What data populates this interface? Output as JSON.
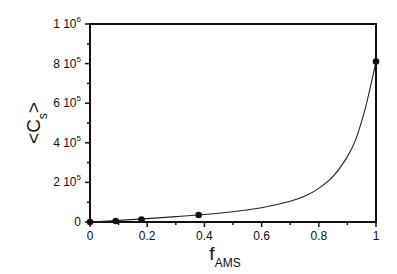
{
  "chart_data": {
    "type": "scatter",
    "title": "",
    "xlabel": "f_AMS",
    "xlabel_main": "f",
    "xlabel_sub": "AMS",
    "ylabel": "<C_s>",
    "ylabel_main": "<C",
    "ylabel_sub": "s",
    "ylabel_end": ">",
    "xlim": [
      0,
      1
    ],
    "ylim": [
      0,
      1000000
    ],
    "x_ticks": [
      0,
      0.2,
      0.4,
      0.6,
      0.8,
      1
    ],
    "x_tick_labels": [
      "0",
      "0.2",
      "0.4",
      "0.6",
      "0.8",
      "1"
    ],
    "y_ticks": [
      0,
      200000,
      400000,
      600000,
      800000,
      1000000
    ],
    "y_tick_labels": [
      {
        "mant": "0",
        "exp": ""
      },
      {
        "mant": "2 10",
        "exp": "5"
      },
      {
        "mant": "4 10",
        "exp": "5"
      },
      {
        "mant": "6 10",
        "exp": "5"
      },
      {
        "mant": "8 10",
        "exp": "5"
      },
      {
        "mant": "1 10",
        "exp": "6"
      }
    ],
    "grid": false,
    "legend": null,
    "series": [
      {
        "name": "data points",
        "style": "markers",
        "x": [
          0,
          0.09,
          0.18,
          0.38,
          1.0
        ],
        "y": [
          0,
          5000,
          12000,
          35000,
          810000
        ]
      },
      {
        "name": "fit curve",
        "style": "line",
        "x": [
          0,
          0.1,
          0.2,
          0.3,
          0.4,
          0.5,
          0.6,
          0.7,
          0.75,
          0.8,
          0.85,
          0.9,
          0.93,
          0.96,
          0.98,
          1.0
        ],
        "y": [
          0,
          8000,
          17000,
          27000,
          38000,
          52000,
          72000,
          105000,
          130000,
          170000,
          230000,
          330000,
          420000,
          560000,
          680000,
          810000
        ]
      }
    ]
  }
}
